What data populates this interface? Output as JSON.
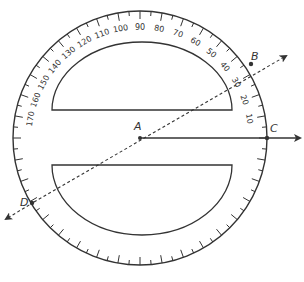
{
  "diagram": {
    "type": "protractor-angle-measurement",
    "colors": {
      "stroke": "#333333",
      "background": "#ffffff"
    },
    "protractor": {
      "center": [
        140,
        138
      ],
      "outer_radius": 127,
      "inner_radius": 90,
      "scale_labels": [
        "10",
        "20",
        "30",
        "40",
        "50",
        "60",
        "70",
        "80",
        "90",
        "100",
        "110",
        "120",
        "130",
        "140",
        "150",
        "160",
        "170"
      ],
      "scale_label_angles": [
        10,
        20,
        30,
        40,
        50,
        60,
        70,
        80,
        90,
        100,
        110,
        120,
        130,
        140,
        150,
        160,
        170
      ]
    },
    "points": {
      "A": {
        "label": "A"
      },
      "B": {
        "label": "B"
      },
      "C": {
        "label": "C"
      },
      "D": {
        "label": "D"
      }
    },
    "lines": {
      "ray_AC": {
        "style": "solid",
        "from": "A",
        "to": "C",
        "arrow": true
      },
      "line_DB": {
        "style": "dashed",
        "through": [
          "D",
          "A",
          "B"
        ],
        "arrows": "both"
      }
    }
  }
}
